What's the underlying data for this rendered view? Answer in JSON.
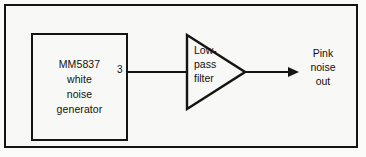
{
  "figure": {
    "kind": "block-diagram",
    "background_color": "#f8f8f6",
    "line_color": "#141414"
  },
  "chip_block": {
    "lines": [
      "MM5837",
      "white",
      "noise",
      "generator"
    ],
    "pin_number": "3"
  },
  "filter_block": {
    "lines": [
      "Low-",
      "pass",
      "filter"
    ],
    "shape": "triangle"
  },
  "output": {
    "lines": [
      "Pink",
      "noise",
      "out"
    ],
    "arrow": "arrow-right-icon"
  }
}
